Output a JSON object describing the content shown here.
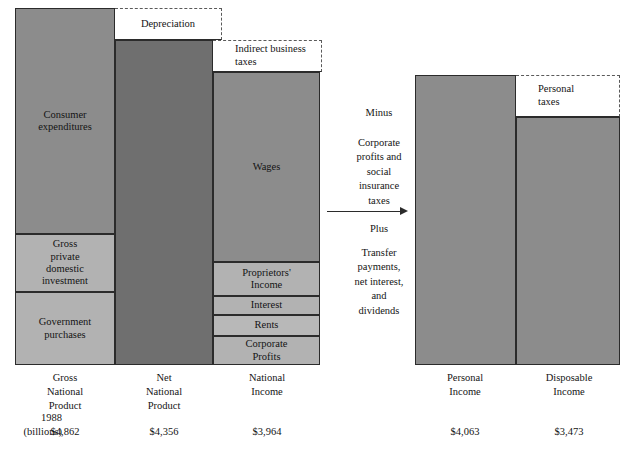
{
  "figure": {
    "units_label": "1988\n(billions)"
  },
  "columns": [
    {
      "key": "gnp",
      "caption": "Gross\nNational\nProduct",
      "value": "$4,862",
      "segments": [
        {
          "name": "consumer-expenditures",
          "label": "Consumer\nexpenditures"
        },
        {
          "name": "gross-private-domestic-investment",
          "label": "Gross\nprivate\ndomestic\ninvestment"
        },
        {
          "name": "government-purchases",
          "label": "Government\npurchases"
        }
      ]
    },
    {
      "key": "nnp",
      "caption": "Net\nNational\nProduct",
      "value": "$4,356",
      "segments": [
        {
          "name": "net-national-product-body",
          "label": ""
        }
      ]
    },
    {
      "key": "ni",
      "caption": "National\nIncome",
      "value": "$3,964",
      "segments": [
        {
          "name": "wages",
          "label": "Wages"
        },
        {
          "name": "proprietors-income",
          "label": "Proprietors'\nIncome"
        },
        {
          "name": "interest",
          "label": "Interest"
        },
        {
          "name": "rents",
          "label": "Rents"
        },
        {
          "name": "corporate-profits",
          "label": "Corporate\nProfits"
        }
      ]
    },
    {
      "key": "pi",
      "caption": "Personal\nIncome",
      "value": "$4,063",
      "segments": [
        {
          "name": "personal-income-body",
          "label": ""
        }
      ]
    },
    {
      "key": "di",
      "caption": "Disposable\nIncome",
      "value": "$3,473",
      "segments": [
        {
          "name": "disposable-income-body",
          "label": ""
        }
      ]
    }
  ],
  "callouts": [
    {
      "name": "depreciation",
      "label": "Depreciation"
    },
    {
      "name": "indirect-business-taxes",
      "label": "Indirect business\ntaxes"
    },
    {
      "name": "personal-taxes",
      "label": "Personal\ntaxes"
    }
  ],
  "transition": {
    "minus_word": "Minus",
    "minus_items": "Corporate\nprofits and\nsocial\ninsurance\ntaxes",
    "plus_word": "Plus",
    "plus_items": "Transfer\npayments,\nnet interest,\nand\ndividends"
  },
  "colors": {
    "fill_mid": "#8c8c8c",
    "fill_dark": "#6f6f6f",
    "fill_light": "#b2b2b2",
    "outline": "#2b2b2b",
    "dashed": "#5a5a5a",
    "background": "#ffffff"
  }
}
